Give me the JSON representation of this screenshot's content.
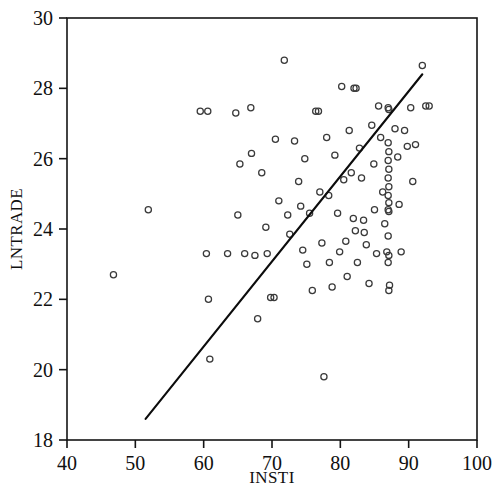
{
  "chart_data": {
    "type": "scatter",
    "title": "",
    "xlabel": "INSTI",
    "ylabel": "LNTRADE",
    "xlim": [
      40,
      100
    ],
    "ylim": [
      18,
      30
    ],
    "xticks": [
      40,
      50,
      60,
      70,
      80,
      90,
      100
    ],
    "yticks": [
      18,
      20,
      22,
      24,
      26,
      28,
      30
    ],
    "grid": false,
    "legend": null,
    "marker": "open-circle",
    "marker_color": "#3a3a3a",
    "line_color": "#0c0c0c",
    "series": [
      {
        "name": "observations",
        "points": [
          [
            46.8,
            22.7
          ],
          [
            51.9,
            24.55
          ],
          [
            59.5,
            27.35
          ],
          [
            60.6,
            27.35
          ],
          [
            60.4,
            23.3
          ],
          [
            60.7,
            22.0
          ],
          [
            60.9,
            20.3
          ],
          [
            63.5,
            23.3
          ],
          [
            64.7,
            27.3
          ],
          [
            65.3,
            25.85
          ],
          [
            65.0,
            24.4
          ],
          [
            66.0,
            23.3
          ],
          [
            66.9,
            27.45
          ],
          [
            67.0,
            26.15
          ],
          [
            67.5,
            23.25
          ],
          [
            67.9,
            21.45
          ],
          [
            68.5,
            25.6
          ],
          [
            69.1,
            24.05
          ],
          [
            69.3,
            23.3
          ],
          [
            69.8,
            22.05
          ],
          [
            70.3,
            22.05
          ],
          [
            70.5,
            26.55
          ],
          [
            71.0,
            24.8
          ],
          [
            71.8,
            28.8
          ],
          [
            72.3,
            24.4
          ],
          [
            72.6,
            23.85
          ],
          [
            73.3,
            26.5
          ],
          [
            73.9,
            25.35
          ],
          [
            74.2,
            24.65
          ],
          [
            74.5,
            23.4
          ],
          [
            74.8,
            26.0
          ],
          [
            75.1,
            23.0
          ],
          [
            75.5,
            24.45
          ],
          [
            75.9,
            22.25
          ],
          [
            76.4,
            27.35
          ],
          [
            76.8,
            27.35
          ],
          [
            77.0,
            25.05
          ],
          [
            77.3,
            23.6
          ],
          [
            77.6,
            19.8
          ],
          [
            78.0,
            26.6
          ],
          [
            78.3,
            24.95
          ],
          [
            78.4,
            23.05
          ],
          [
            78.8,
            22.35
          ],
          [
            79.2,
            26.1
          ],
          [
            79.6,
            24.45
          ],
          [
            79.9,
            23.35
          ],
          [
            80.2,
            28.05
          ],
          [
            80.5,
            25.4
          ],
          [
            80.8,
            23.65
          ],
          [
            81.0,
            22.65
          ],
          [
            81.3,
            26.8
          ],
          [
            81.6,
            25.6
          ],
          [
            81.9,
            24.3
          ],
          [
            82.0,
            28.0
          ],
          [
            82.3,
            28.0
          ],
          [
            82.2,
            23.95
          ],
          [
            82.5,
            23.05
          ],
          [
            82.8,
            26.3
          ],
          [
            83.1,
            25.45
          ],
          [
            83.4,
            24.25
          ],
          [
            83.5,
            23.9
          ],
          [
            83.8,
            23.55
          ],
          [
            84.2,
            22.45
          ],
          [
            84.6,
            26.95
          ],
          [
            84.9,
            25.85
          ],
          [
            85.0,
            24.55
          ],
          [
            85.3,
            23.3
          ],
          [
            85.6,
            27.5
          ],
          [
            85.9,
            26.6
          ],
          [
            86.2,
            25.05
          ],
          [
            86.5,
            24.15
          ],
          [
            86.8,
            23.35
          ],
          [
            87.0,
            27.45
          ],
          [
            87.1,
            27.4
          ],
          [
            87.0,
            26.45
          ],
          [
            87.1,
            26.2
          ],
          [
            87.0,
            25.95
          ],
          [
            87.1,
            25.7
          ],
          [
            87.0,
            25.45
          ],
          [
            87.1,
            25.2
          ],
          [
            87.0,
            24.95
          ],
          [
            87.1,
            24.75
          ],
          [
            87.0,
            24.55
          ],
          [
            87.1,
            24.5
          ],
          [
            87.0,
            23.8
          ],
          [
            87.1,
            23.25
          ],
          [
            87.0,
            23.05
          ],
          [
            87.2,
            22.4
          ],
          [
            87.1,
            22.25
          ],
          [
            88.0,
            26.85
          ],
          [
            88.4,
            26.05
          ],
          [
            88.6,
            24.7
          ],
          [
            88.9,
            23.35
          ],
          [
            89.4,
            26.8
          ],
          [
            89.8,
            26.35
          ],
          [
            90.3,
            27.45
          ],
          [
            90.6,
            25.35
          ],
          [
            91.0,
            26.4
          ],
          [
            92.0,
            28.65
          ],
          [
            92.5,
            27.5
          ],
          [
            93.0,
            27.5
          ]
        ]
      }
    ],
    "fit_line": {
      "name": "regression-line",
      "x_start": 51.5,
      "y_start": 18.6,
      "x_end": 92.0,
      "y_end": 28.4
    }
  },
  "axes": {
    "x_tick_labels": [
      "40",
      "50",
      "60",
      "70",
      "80",
      "90",
      "100"
    ],
    "y_tick_labels": [
      "18",
      "20",
      "22",
      "24",
      "26",
      "28",
      "30"
    ],
    "x_axis_title": "INSTI",
    "y_axis_title": "LNTRADE"
  }
}
